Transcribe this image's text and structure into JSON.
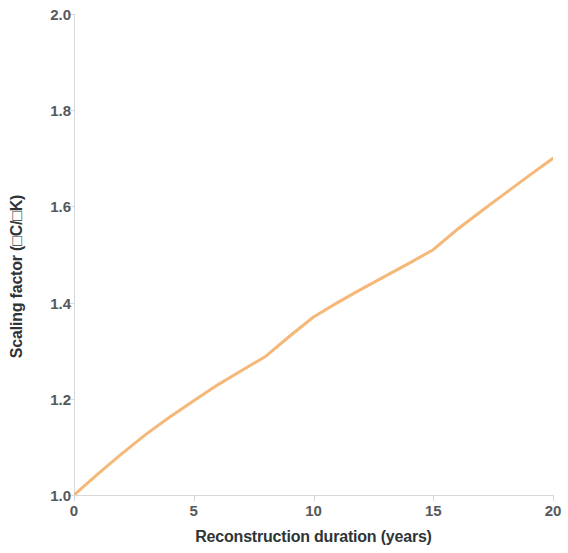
{
  "chart_data": {
    "type": "line",
    "title": "",
    "xlabel": "Reconstruction duration (years)",
    "ylabel": "Scaling factor (□C/□K)",
    "xlim": [
      0,
      20
    ],
    "ylim": [
      1.0,
      2.0
    ],
    "xticks": [
      0,
      5,
      10,
      15,
      20
    ],
    "xtick_labels": [
      "0",
      "5",
      "10",
      "15",
      "20"
    ],
    "yticks": [
      1.0,
      1.2,
      1.4,
      1.6,
      1.8,
      2.0
    ],
    "ytick_labels": [
      "1.0",
      "1.2",
      "1.4",
      "1.6",
      "1.8",
      "2.0"
    ],
    "grid": false,
    "legend": false,
    "legend_position": "none",
    "line_color": "#f5b878",
    "line_width": 3,
    "series": [
      {
        "name": "Scaling factor",
        "color": "#f5b878",
        "x": [
          0,
          1,
          2,
          3,
          4,
          5,
          6,
          7,
          8,
          9,
          10,
          11,
          12,
          13,
          14,
          15,
          16,
          17,
          18,
          19,
          20
        ],
        "values": [
          1.0,
          1.044,
          1.086,
          1.126,
          1.162,
          1.196,
          1.229,
          1.259,
          1.288,
          1.33,
          1.37,
          1.4,
          1.428,
          1.455,
          1.482,
          1.51,
          1.552,
          1.59,
          1.627,
          1.664,
          1.7
        ]
      }
    ],
    "annotations": []
  },
  "axes": {
    "ylabel_text": "Scaling factor (□C/□K)",
    "xlabel_text": "Reconstruction duration (years)"
  },
  "colors": {
    "line": "#f5b878",
    "axis": "#d8d8d8",
    "tick_text": "#55595c",
    "label_text": "#2f3437",
    "background": "#ffffff"
  }
}
